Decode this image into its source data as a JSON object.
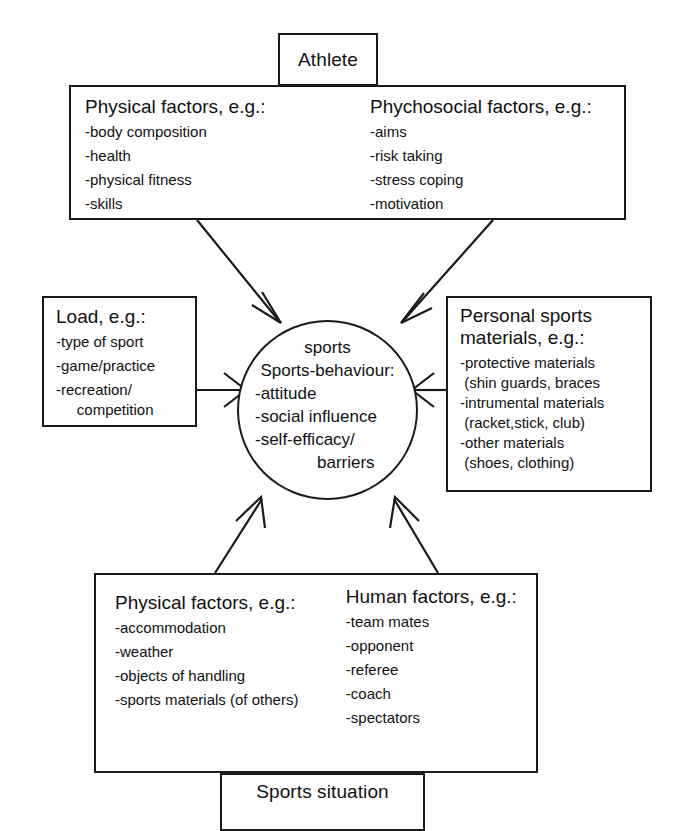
{
  "diagram": {
    "title_top": "Athlete",
    "title_bottom": "Sports situation",
    "hub": {
      "overline": "sports",
      "heading": "Sports-behaviour:",
      "items": [
        "-attitude",
        "-social influence",
        "-self-efficacy/",
        "barriers"
      ]
    },
    "athlete_panel": {
      "left": {
        "heading": "Physical factors, e.g.:",
        "items": [
          "-body composition",
          "-health",
          "-physical fitness",
          "-skills"
        ]
      },
      "right": {
        "heading": "Phychosocial factors, e.g.:",
        "items": [
          "-aims",
          "-risk taking",
          "-stress coping",
          "-motivation"
        ]
      }
    },
    "load_box": {
      "heading": "Load, e.g.:",
      "items": [
        "-type of sport",
        "-game/practice",
        "-recreation/",
        "     competition"
      ]
    },
    "materials_box": {
      "heading": "Personal sports\nmaterials, e.g.:",
      "items": [
        "-protective materials",
        " (shin guards, braces",
        "-intrumental materials",
        " (racket,stick, club)",
        "-other materials",
        " (shoes, clothing)"
      ]
    },
    "situation_panel": {
      "left": {
        "heading": "Physical factors, e.g.:",
        "items": [
          "-accommodation",
          "-weather",
          "-objects of handling",
          "-sports materials (of others)"
        ]
      },
      "right": {
        "heading": "Human factors, e.g.:",
        "items": [
          "-team mates",
          "-opponent",
          "-referee",
          "-coach",
          "-spectators"
        ]
      }
    },
    "colors": {
      "stroke": "#1a1a1a",
      "background": "#ffffff",
      "text": "#111111"
    }
  }
}
